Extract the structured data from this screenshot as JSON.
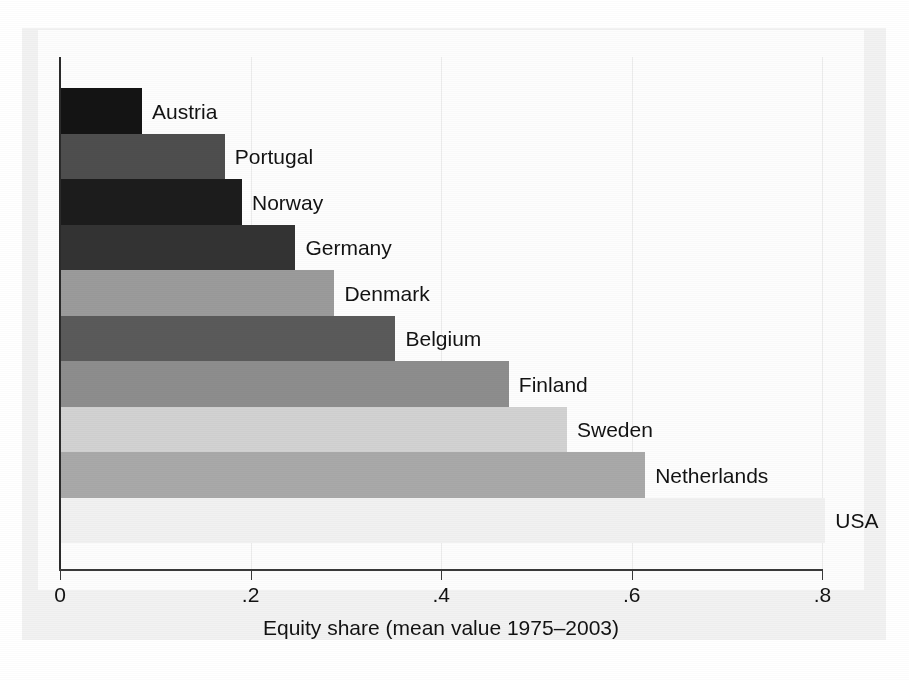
{
  "chart_data": {
    "type": "bar",
    "orientation": "horizontal",
    "title": "",
    "xlabel": "Equity share (mean value 1975–2003)",
    "ylabel": "",
    "xlim": [
      0,
      0.855
    ],
    "ylim": null,
    "grid": "vertical gridlines at x ticks, faint",
    "legend": "none (bars labelled inline at bar end)",
    "xticks": [
      "0",
      ".2",
      ".4",
      ".6",
      ".8"
    ],
    "xtick_values": [
      0,
      0.2,
      0.4,
      0.6,
      0.8
    ],
    "categories": [
      "Austria",
      "Portugal",
      "Norway",
      "Germany",
      "Denmark",
      "Belgium",
      "Finland",
      "Sweden",
      "Netherlands",
      "USA"
    ],
    "values": [
      0.086,
      0.173,
      0.191,
      0.247,
      0.288,
      0.352,
      0.471,
      0.532,
      0.614,
      0.803
    ],
    "bar_fills": [
      "#141414",
      "#4e4e4e",
      "#1c1c1c",
      "#333333",
      "#9b9b9b",
      "#5a5a5a",
      "#8d8d8d",
      "#d2d2d2",
      "#a9a9a9",
      "#f1f1f1"
    ],
    "series": [
      {
        "name": "Equity share (mean value 1975–2003)",
        "values": [
          0.086,
          0.173,
          0.191,
          0.247,
          0.288,
          0.352,
          0.471,
          0.532,
          0.614,
          0.803
        ]
      }
    ]
  },
  "axis": {
    "x_title": "Equity share (mean value 1975–2003)",
    "tick_labels": [
      "0",
      ".2",
      ".4",
      ".6",
      ".8"
    ]
  },
  "bar_labels": [
    "Austria",
    "Portugal",
    "Norway",
    "Germany",
    "Denmark",
    "Belgium",
    "Finland",
    "Sweden",
    "Netherlands",
    "USA"
  ]
}
